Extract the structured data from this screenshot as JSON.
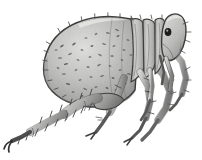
{
  "image": {
    "domain": "Natural-Image",
    "medium": "pencil-and-ink-scientific-illustration",
    "subject_common_name": "Flea",
    "subject_order": "Siphonaptera",
    "view": "left lateral view",
    "orientation": "head at right, abdomen at left",
    "width_px": 202,
    "height_px": 160,
    "background_color": "#ffffff",
    "palette": {
      "background": "#ffffff",
      "body_light": "#d6d6d4",
      "body_mid": "#b4b4b2",
      "body_shadow": "#8d8d8c",
      "outline": "#3d3d3d",
      "deep_shadow": "#5a5a5a",
      "eye_dark": "#1c1c1c",
      "hair_stroke": "#4a4a4a",
      "speckle": "#575757"
    }
  },
  "anatomy": {
    "abdomen": {
      "label": "abdomen",
      "position": "left two-thirds of frame",
      "shape": "large teardrop, pointed at lower-left posterior tip",
      "fill": "#c4c4c2",
      "texture": "scattered dark comma-shaped setal bases",
      "speckle_count": 46,
      "bbox": [
        42,
        18,
        146,
        104
      ]
    },
    "thorax": {
      "label": "thorax",
      "position": "right of abdomen",
      "shape": "three vertical overlapping segment bands",
      "segment_count": 3,
      "fill": "#bcbcba",
      "bbox": [
        126,
        16,
        164,
        82
      ]
    },
    "head": {
      "label": "head",
      "position": "upper right",
      "shape": "rounded helmet-like capsule",
      "fill": "#c9c9c7",
      "bbox": [
        150,
        14,
        186,
        60
      ]
    },
    "eye": {
      "label": "eye",
      "shape": "small dark oval spot",
      "color": "#1c1c1c",
      "center": [
        168,
        32
      ],
      "radius_px": 3.4
    },
    "mouthparts": {
      "label": "mouthparts",
      "description": "downward-pointing stylets below head",
      "bbox": [
        158,
        52,
        186,
        92
      ]
    },
    "legs": [
      {
        "id": "hind-leg-left",
        "label": "hind leg (left)",
        "role": "jumping leg",
        "direction": "sweeps down and to the far lower-left",
        "segments": [
          "coxa",
          "femur",
          "tibia",
          "tarsus",
          "claw"
        ],
        "bristles": true
      },
      {
        "id": "hind-leg-right",
        "label": "hind leg (right)",
        "role": "jumping leg",
        "direction": "down-left, shorter overlap",
        "segments": [
          "coxa",
          "femur",
          "tibia",
          "tarsus",
          "claw"
        ],
        "bristles": true
      },
      {
        "id": "mid-leg-left",
        "label": "middle leg (left)",
        "direction": "down and slightly left to mid-bottom",
        "segments": [
          "coxa",
          "femur",
          "tibia",
          "tarsus",
          "claw"
        ],
        "bristles": true
      },
      {
        "id": "mid-leg-right",
        "label": "middle leg (right)",
        "direction": "down, center-right",
        "segments": [
          "coxa",
          "femur",
          "tibia",
          "tarsus",
          "claw"
        ],
        "bristles": true
      },
      {
        "id": "fore-leg-left",
        "label": "front leg (left)",
        "direction": "down from head, short",
        "segments": [
          "coxa",
          "femur",
          "tibia",
          "tarsus",
          "claw"
        ],
        "bristles": true
      },
      {
        "id": "fore-leg-right",
        "label": "front leg (right)",
        "direction": "down and right under head",
        "segments": [
          "coxa",
          "femur",
          "tibia",
          "tarsus",
          "claw"
        ],
        "bristles": true
      }
    ],
    "setae": {
      "label": "setae / bristles",
      "description": "fine hair strokes along body margin and leg edges",
      "color": "#4a4a4a"
    }
  },
  "texture": {
    "abdomen_speckles": [
      [
        74,
        44
      ],
      [
        86,
        38
      ],
      [
        96,
        34
      ],
      [
        108,
        33
      ],
      [
        118,
        36
      ],
      [
        128,
        40
      ],
      [
        70,
        54
      ],
      [
        82,
        50
      ],
      [
        92,
        46
      ],
      [
        104,
        44
      ],
      [
        114,
        46
      ],
      [
        124,
        50
      ],
      [
        66,
        64
      ],
      [
        78,
        60
      ],
      [
        90,
        57
      ],
      [
        100,
        55
      ],
      [
        112,
        56
      ],
      [
        122,
        60
      ],
      [
        64,
        74
      ],
      [
        76,
        70
      ],
      [
        88,
        67
      ],
      [
        99,
        65
      ],
      [
        110,
        66
      ],
      [
        120,
        70
      ],
      [
        68,
        84
      ],
      [
        80,
        80
      ],
      [
        91,
        77
      ],
      [
        102,
        76
      ],
      [
        113,
        78
      ],
      [
        73,
        92
      ],
      [
        85,
        89
      ],
      [
        96,
        87
      ],
      [
        107,
        88
      ],
      [
        60,
        58
      ],
      [
        58,
        68
      ],
      [
        56,
        50
      ],
      [
        62,
        46
      ],
      [
        131,
        55
      ],
      [
        133,
        66
      ],
      [
        129,
        74
      ],
      [
        125,
        84
      ],
      [
        116,
        90
      ],
      [
        104,
        95
      ],
      [
        93,
        97
      ],
      [
        82,
        96
      ],
      [
        117,
        30
      ]
    ],
    "margin_hairs": [
      [
        50,
        44,
        -150
      ],
      [
        48,
        52,
        -160
      ],
      [
        47,
        61,
        -170
      ],
      [
        48,
        70,
        -178
      ],
      [
        52,
        80,
        170
      ],
      [
        58,
        88,
        160
      ],
      [
        66,
        95,
        150
      ],
      [
        76,
        100,
        140
      ],
      [
        60,
        32,
        -120
      ],
      [
        70,
        26,
        -110
      ],
      [
        82,
        21,
        -100
      ],
      [
        95,
        18,
        -95
      ],
      [
        108,
        17,
        -92
      ],
      [
        120,
        18,
        -90
      ],
      [
        131,
        21,
        -88
      ]
    ]
  },
  "accessibility": {
    "alt_text": "Grayscale pencil illustration of a flea in left lateral view with a large speckled abdomen, segmented thorax, small head with a dark eye, and six bristled legs including a long hind jumping leg."
  }
}
